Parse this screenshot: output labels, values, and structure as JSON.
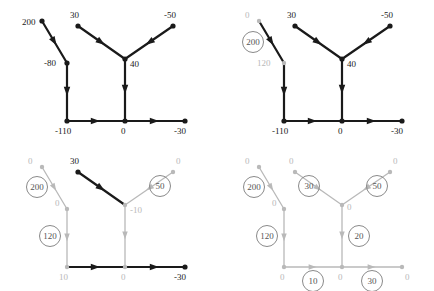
{
  "figure": {
    "title": "",
    "panel_count": 4,
    "panel_width": 217,
    "panel_height": 145
  },
  "chart_data": {
    "type": "diagram",
    "title": "",
    "xlabel": "",
    "ylabel": "",
    "panels": [
      {
        "id": "panel-1",
        "node_labels": [
          "200",
          "30",
          "-50",
          "-80",
          "40",
          "-110",
          "0",
          "-30"
        ],
        "edge_labels": [],
        "values": [
          200,
          30,
          -50,
          -80,
          40,
          -110,
          0,
          -30
        ]
      },
      {
        "id": "panel-2",
        "node_labels": [
          "0",
          "30",
          "-50",
          "120",
          "40",
          "-110",
          "0",
          "-30"
        ],
        "edge_labels": [
          "200"
        ],
        "values": [
          0,
          30,
          -50,
          120,
          40,
          -110,
          0,
          -30
        ]
      },
      {
        "id": "panel-3",
        "node_labels": [
          "0",
          "30",
          "0",
          "0",
          "-10",
          "10",
          "0",
          "-30"
        ],
        "edge_labels": [
          "200",
          "120",
          "50"
        ],
        "values": [
          0,
          30,
          0,
          0,
          -10,
          10,
          0,
          -30
        ]
      },
      {
        "id": "panel-4",
        "node_labels": [
          "0",
          "0",
          "0",
          "0",
          "0",
          "0",
          "0",
          "0"
        ],
        "edge_labels": [
          "200",
          "30",
          "50",
          "120",
          "20",
          "10",
          "30"
        ],
        "values": [
          0,
          0,
          0,
          0,
          0,
          0,
          0,
          0
        ]
      }
    ]
  },
  "panel1": {
    "name": "panel-initial",
    "nodes": [
      {
        "id": "n-topleft",
        "label": "200",
        "x": 42,
        "y": 21,
        "lx": 22,
        "ly": 25,
        "style": "dark"
      },
      {
        "id": "n-topmid",
        "label": "30",
        "x": 78,
        "y": 26,
        "lx": 70,
        "ly": 18,
        "style": "dark"
      },
      {
        "id": "n-topright",
        "label": "-50",
        "x": 173,
        "y": 26,
        "lx": 164,
        "ly": 18,
        "style": "dark"
      },
      {
        "id": "n-mid",
        "label": "-80",
        "x": 67,
        "y": 63,
        "lx": 44,
        "ly": 66,
        "style": "dark"
      },
      {
        "id": "n-center",
        "label": "40",
        "x": 125,
        "y": 59,
        "lx": 130,
        "ly": 67,
        "style": "dark"
      },
      {
        "id": "n-botleft",
        "label": "-110",
        "x": 67,
        "y": 121,
        "lx": 55,
        "ly": 134,
        "style": "dark"
      },
      {
        "id": "n-botmid",
        "label": "0",
        "x": 125,
        "y": 121,
        "lx": 121,
        "ly": 134,
        "style": "dark"
      },
      {
        "id": "n-botright",
        "label": "-30",
        "x": 185,
        "y": 121,
        "lx": 174,
        "ly": 134,
        "style": "dark"
      }
    ],
    "edges": [
      {
        "id": "e-topleft-mid",
        "from": "n-topleft",
        "to": "n-mid",
        "style": "dark",
        "circled": null
      },
      {
        "id": "e-mid-botleft",
        "from": "n-mid",
        "to": "n-botleft",
        "style": "dark",
        "circled": null
      },
      {
        "id": "e-topmid-center",
        "from": "n-topmid",
        "to": "n-center",
        "style": "dark",
        "circled": null
      },
      {
        "id": "e-topright-center",
        "from": "n-topright",
        "to": "n-center",
        "style": "dark",
        "circled": null
      },
      {
        "id": "e-center-botmid",
        "from": "n-center",
        "to": "n-botmid",
        "style": "dark",
        "circled": null
      },
      {
        "id": "e-botleft-botmid",
        "from": "n-botleft",
        "to": "n-botmid",
        "style": "dark",
        "circled": null
      },
      {
        "id": "e-botmid-botright",
        "from": "n-botmid",
        "to": "n-botright",
        "style": "dark",
        "circled": null
      }
    ]
  },
  "panel2": {
    "name": "panel-step-1",
    "nodes": [
      {
        "id": "n-topleft",
        "label": "0",
        "x": 42,
        "y": 21,
        "lx": 28,
        "ly": 18,
        "style": "gray"
      },
      {
        "id": "n-topmid",
        "label": "30",
        "x": 78,
        "y": 26,
        "lx": 70,
        "ly": 18,
        "style": "dark"
      },
      {
        "id": "n-topright",
        "label": "-50",
        "x": 173,
        "y": 26,
        "lx": 164,
        "ly": 18,
        "style": "dark"
      },
      {
        "id": "n-mid",
        "label": "120",
        "x": 67,
        "y": 63,
        "lx": 40,
        "ly": 66,
        "style": "gray"
      },
      {
        "id": "n-center",
        "label": "40",
        "x": 125,
        "y": 59,
        "lx": 130,
        "ly": 67,
        "style": "dark"
      },
      {
        "id": "n-botleft",
        "label": "-110",
        "x": 67,
        "y": 121,
        "lx": 55,
        "ly": 134,
        "style": "dark"
      },
      {
        "id": "n-botmid",
        "label": "0",
        "x": 125,
        "y": 121,
        "lx": 121,
        "ly": 134,
        "style": "dark"
      },
      {
        "id": "n-botright",
        "label": "-30",
        "x": 185,
        "y": 121,
        "lx": 174,
        "ly": 134,
        "style": "dark"
      }
    ],
    "edges": [
      {
        "id": "e-topleft-mid",
        "from": "n-topleft",
        "to": "n-mid",
        "style": "dark",
        "circled": "200",
        "cx": 36,
        "cy": 42
      },
      {
        "id": "e-mid-botleft",
        "from": "n-mid",
        "to": "n-botleft",
        "style": "dark",
        "circled": null
      },
      {
        "id": "e-topmid-center",
        "from": "n-topmid",
        "to": "n-center",
        "style": "dark",
        "circled": null
      },
      {
        "id": "e-topright-center",
        "from": "n-topright",
        "to": "n-center",
        "style": "dark",
        "circled": null
      },
      {
        "id": "e-center-botmid",
        "from": "n-center",
        "to": "n-botmid",
        "style": "dark",
        "circled": null
      },
      {
        "id": "e-botleft-botmid",
        "from": "n-botleft",
        "to": "n-botmid",
        "style": "dark",
        "circled": null
      },
      {
        "id": "e-botmid-botright",
        "from": "n-botmid",
        "to": "n-botright",
        "style": "dark",
        "circled": null
      }
    ]
  },
  "panel3": {
    "name": "panel-step-2",
    "nodes": [
      {
        "id": "n-topleft",
        "label": "0",
        "x": 42,
        "y": 21,
        "lx": 28,
        "ly": 18,
        "style": "gray"
      },
      {
        "id": "n-topmid",
        "label": "30",
        "x": 78,
        "y": 26,
        "lx": 70,
        "ly": 18,
        "style": "dark"
      },
      {
        "id": "n-topright",
        "label": "0",
        "x": 173,
        "y": 26,
        "lx": 176,
        "ly": 18,
        "style": "gray"
      },
      {
        "id": "n-mid",
        "label": "0",
        "x": 67,
        "y": 63,
        "lx": 55,
        "ly": 60,
        "style": "gray"
      },
      {
        "id": "n-center",
        "label": "-10",
        "x": 125,
        "y": 59,
        "lx": 130,
        "ly": 67,
        "style": "gray"
      },
      {
        "id": "n-botleft",
        "label": "10",
        "x": 67,
        "y": 121,
        "lx": 59,
        "ly": 134,
        "style": "gray"
      },
      {
        "id": "n-botmid",
        "label": "0",
        "x": 125,
        "y": 121,
        "lx": 121,
        "ly": 134,
        "style": "gray"
      },
      {
        "id": "n-botright",
        "label": "-30",
        "x": 185,
        "y": 121,
        "lx": 174,
        "ly": 134,
        "style": "dark"
      }
    ],
    "edges": [
      {
        "id": "e-topleft-mid",
        "from": "n-topleft",
        "to": "n-mid",
        "style": "gray",
        "circled": "200",
        "cx": 37,
        "cy": 41
      },
      {
        "id": "e-mid-botleft",
        "from": "n-mid",
        "to": "n-botleft",
        "style": "gray",
        "circled": "120",
        "cx": 50,
        "cy": 90
      },
      {
        "id": "e-topmid-center",
        "from": "n-topmid",
        "to": "n-center",
        "style": "dark",
        "circled": null
      },
      {
        "id": "e-topright-center",
        "from": "n-topright",
        "to": "n-center",
        "style": "gray",
        "circled": "50",
        "cx": 160,
        "cy": 40
      },
      {
        "id": "e-center-botmid",
        "from": "n-center",
        "to": "n-botmid",
        "style": "gray",
        "circled": null
      },
      {
        "id": "e-botleft-botmid",
        "from": "n-botleft",
        "to": "n-botmid",
        "style": "dark",
        "circled": null
      },
      {
        "id": "e-botmid-botright",
        "from": "n-botmid",
        "to": "n-botright",
        "style": "dark",
        "circled": null
      }
    ]
  },
  "panel4": {
    "name": "panel-final",
    "nodes": [
      {
        "id": "n-topleft",
        "label": "0",
        "x": 42,
        "y": 21,
        "lx": 28,
        "ly": 18,
        "style": "gray"
      },
      {
        "id": "n-topmid",
        "label": "0",
        "x": 78,
        "y": 26,
        "lx": 72,
        "ly": 18,
        "style": "gray"
      },
      {
        "id": "n-topright",
        "label": "0",
        "x": 173,
        "y": 26,
        "lx": 176,
        "ly": 18,
        "style": "gray"
      },
      {
        "id": "n-mid",
        "label": "0",
        "x": 67,
        "y": 63,
        "lx": 55,
        "ly": 60,
        "style": "gray"
      },
      {
        "id": "n-center",
        "label": "0",
        "x": 125,
        "y": 59,
        "lx": 130,
        "ly": 64,
        "style": "gray"
      },
      {
        "id": "n-botleft",
        "label": "0",
        "x": 67,
        "y": 121,
        "lx": 63,
        "ly": 134,
        "style": "gray"
      },
      {
        "id": "n-botmid",
        "label": "0",
        "x": 125,
        "y": 121,
        "lx": 121,
        "ly": 134,
        "style": "gray"
      },
      {
        "id": "n-botright",
        "label": "0",
        "x": 185,
        "y": 121,
        "lx": 188,
        "ly": 134,
        "style": "gray"
      }
    ],
    "edges": [
      {
        "id": "e-topleft-mid",
        "from": "n-topleft",
        "to": "n-mid",
        "style": "gray",
        "circled": "200",
        "cx": 37,
        "cy": 41
      },
      {
        "id": "e-mid-botleft",
        "from": "n-mid",
        "to": "n-botleft",
        "style": "gray",
        "circled": "120",
        "cx": 50,
        "cy": 90
      },
      {
        "id": "e-topmid-center",
        "from": "n-topmid",
        "to": "n-center",
        "style": "gray",
        "circled": "30",
        "cx": 92,
        "cy": 40
      },
      {
        "id": "e-topright-center",
        "from": "n-topright",
        "to": "n-center",
        "style": "gray",
        "circled": "50",
        "cx": 160,
        "cy": 40
      },
      {
        "id": "e-center-botmid",
        "from": "n-center",
        "to": "n-botmid",
        "style": "gray",
        "circled": "20",
        "cx": 142,
        "cy": 90
      },
      {
        "id": "e-botleft-botmid",
        "from": "n-botleft",
        "to": "n-botmid",
        "style": "gray",
        "circled": "10",
        "cx": 96,
        "cy": 135
      },
      {
        "id": "e-botmid-botright",
        "from": "n-botmid",
        "to": "n-botright",
        "style": "gray",
        "circled": "30",
        "cx": 155,
        "cy": 135
      }
    ]
  }
}
